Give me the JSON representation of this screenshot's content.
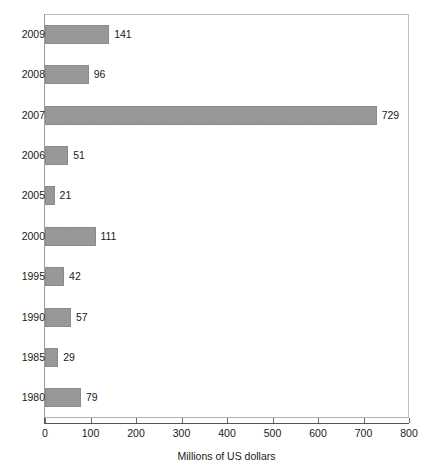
{
  "chart_data": {
    "type": "bar",
    "orientation": "horizontal",
    "title": "",
    "subtitle": "",
    "xlabel": "Millions of US dollars",
    "ylabel": "",
    "categories": [
      "2009",
      "2008",
      "2007",
      "2006",
      "2005",
      "2000",
      "1995",
      "1990",
      "1985",
      "1980"
    ],
    "values": [
      141,
      96,
      729,
      51,
      21,
      111,
      42,
      57,
      29,
      79
    ],
    "data_labels": [
      "141",
      "96",
      "729",
      "51",
      "21",
      "111",
      "42",
      "57",
      "29",
      "79"
    ],
    "xlim": [
      0,
      800
    ],
    "xticks": [
      0,
      100,
      200,
      300,
      400,
      500,
      600,
      700,
      800
    ],
    "xtick_labels": [
      "0",
      "100",
      "200",
      "300",
      "400",
      "500",
      "600",
      "700",
      "800"
    ],
    "grid": false,
    "legend": null,
    "bar_color": "#9a9a9a",
    "bar_edge_color": "#8b8b8b",
    "frame_color": "#b4b4b4",
    "axis_color": "#555555",
    "text_color": "#1a1a1a",
    "background": "#ffffff"
  }
}
